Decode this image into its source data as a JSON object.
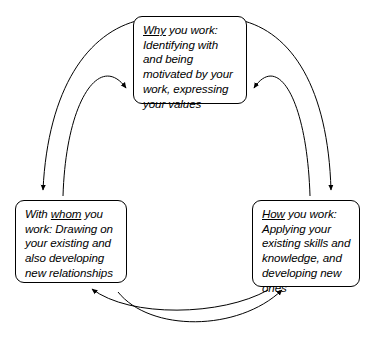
{
  "diagram": {
    "type": "cycle",
    "title": "",
    "background_color": "#ffffff",
    "line_color": "#000000",
    "text_color": "#000000",
    "nodes": [
      {
        "id": "why",
        "position": "top",
        "keyword": "Why",
        "text_after_keyword": " you work: Identifying with and being motivated by your work, expressing your values",
        "full_text": "Why you work: Identifying with and being motivated by your work, expressing your values"
      },
      {
        "id": "whom",
        "position": "left",
        "text_before_keyword": "With ",
        "keyword": "whom",
        "text_after_keyword": " you work: Drawing on your existing and also developing new relationships",
        "full_text": "With whom you work: Drawing on your existing and also developing new relationships"
      },
      {
        "id": "how",
        "position": "right",
        "keyword": "How",
        "text_after_keyword": " you work: Applying your existing skills and knowledge, and developing new ones",
        "full_text": "How you work: Applying your existing skills and knowledge, and developing new ones"
      }
    ],
    "connections": [
      {
        "id": "why-to-whom",
        "from": "why",
        "to": "whom",
        "side": "left",
        "curve": "outer"
      },
      {
        "id": "whom-to-why",
        "from": "whom",
        "to": "why",
        "side": "left",
        "curve": "inner"
      },
      {
        "id": "why-to-how",
        "from": "why",
        "to": "how",
        "side": "right",
        "curve": "outer"
      },
      {
        "id": "how-to-why",
        "from": "how",
        "to": "why",
        "side": "right",
        "curve": "inner"
      },
      {
        "id": "how-to-whom",
        "from": "how",
        "to": "whom",
        "side": "bottom",
        "curve": "inner"
      },
      {
        "id": "whom-to-how",
        "from": "whom",
        "to": "how",
        "side": "bottom",
        "curve": "outer"
      }
    ]
  }
}
